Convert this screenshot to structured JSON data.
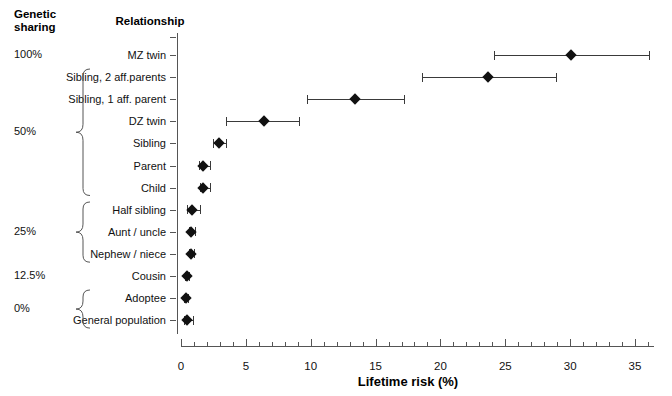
{
  "header": {
    "genetic_sharing": "Genetic\nsharing",
    "genetic_sharing_line1": "Genetic",
    "genetic_sharing_line2": "sharing",
    "relationship": "Relationship"
  },
  "axis": {
    "xlabel": "Lifetime risk (%)",
    "ticks": [
      0,
      5,
      10,
      15,
      20,
      25,
      30,
      35
    ],
    "tick_labels": [
      "0",
      "5",
      "10",
      "15",
      "20",
      "25",
      "30",
      "35"
    ],
    "minor_tick_step": 1,
    "xmin": 0,
    "xmax": 36.5
  },
  "genetic_groups": [
    {
      "label": "100%",
      "rows": [
        0
      ],
      "brace": false
    },
    {
      "label": "50%",
      "rows": [
        1,
        2,
        3,
        4,
        5,
        6
      ],
      "brace": true
    },
    {
      "label": "25%",
      "rows": [
        7,
        8,
        9
      ],
      "brace": true
    },
    {
      "label": "12.5%",
      "rows": [
        10
      ],
      "brace": false
    },
    {
      "label": "0%",
      "rows": [
        11,
        12
      ],
      "brace": true
    }
  ],
  "chart_data": {
    "type": "scatter",
    "title": "",
    "xlabel": "Lifetime risk (%)",
    "ylabel": "Relationship",
    "xlim": [
      0,
      36.5
    ],
    "grid": false,
    "legend": null,
    "categories": [
      "MZ twin",
      "Sibling, 2 aff.parents",
      "Sibling, 1 aff. parent",
      "DZ twin",
      "Sibling",
      "Parent",
      "Child",
      "Half sibling",
      "Aunt / uncle",
      "Nephew / niece",
      "Cousin",
      "Adoptee",
      "General population"
    ],
    "values": [
      30.1,
      23.7,
      13.4,
      6.4,
      2.9,
      1.7,
      1.7,
      0.85,
      0.8,
      0.8,
      0.45,
      0.4,
      0.5
    ],
    "ci_low": [
      24.1,
      18.6,
      9.7,
      3.5,
      2.5,
      1.4,
      1.5,
      0.5,
      0.6,
      0.6,
      0.3,
      0.25,
      0.2
    ],
    "ci_high": [
      36.1,
      28.9,
      17.2,
      9.1,
      3.5,
      2.2,
      2.2,
      1.5,
      1.1,
      1.0,
      0.6,
      0.55,
      0.9
    ],
    "genetic_sharing": [
      "100%",
      "50%",
      "50%",
      "50%",
      "50%",
      "50%",
      "50%",
      "25%",
      "25%",
      "25%",
      "12.5%",
      "0%",
      "0%"
    ]
  },
  "colors": {
    "marker": "#111111",
    "line": "#3a3a3a",
    "axis": "#555555",
    "text": "#111111",
    "background": "#ffffff"
  }
}
